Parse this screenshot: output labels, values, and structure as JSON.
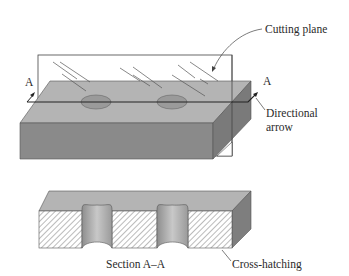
{
  "figure": {
    "labels": {
      "cutting_plane": "Cutting plane",
      "section_left": "A",
      "section_right": "A",
      "directional_line1": "Directional",
      "directional_line2": "arrow",
      "section_title": "Section A–A",
      "cross_hatching": "Cross-hatching"
    },
    "colors": {
      "top_face": "#b4b4b4",
      "front_face": "#8a8a8a",
      "side_face": "#7a7a7a",
      "hole": "#9a9a9a",
      "hatch_bg": "#ffffff",
      "line": "#333333"
    }
  }
}
